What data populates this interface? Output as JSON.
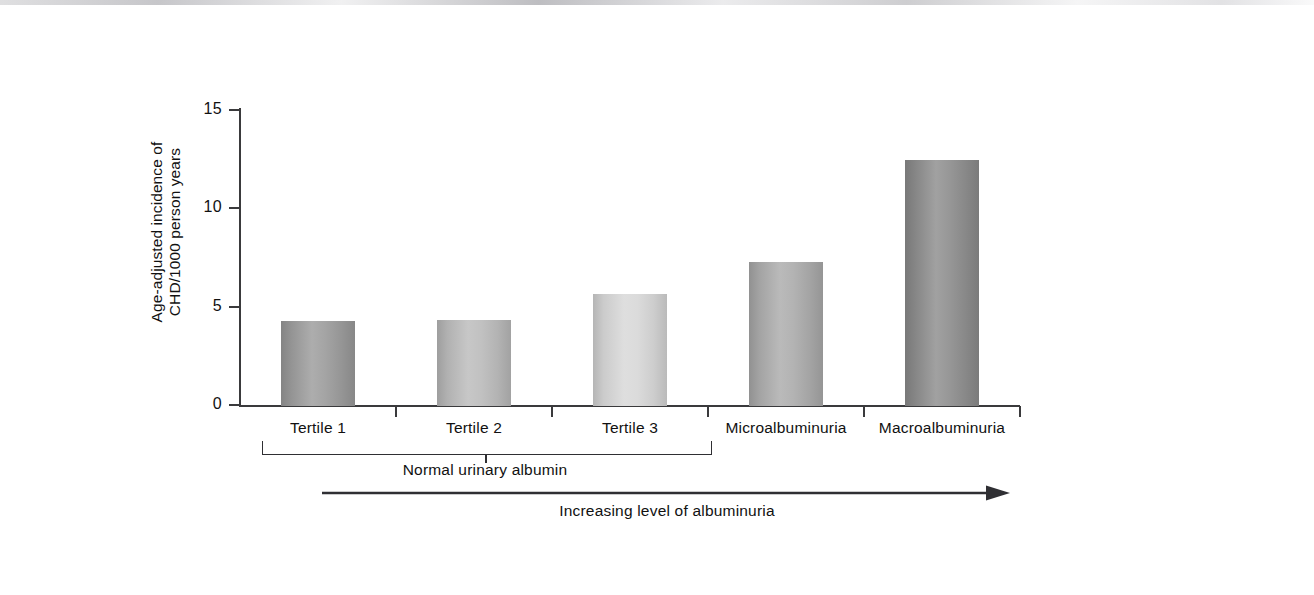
{
  "figure": {
    "y_axis_title_line1": "Age-adjusted incidence of",
    "y_axis_title_line2": "CHD/1000 person years",
    "group_bracket_label": "Normal urinary albumin",
    "trend_caption": "Increasing level of albuminuria",
    "axis_color": "#3a3a3c",
    "text_color": "#111111"
  },
  "chart_data": {
    "type": "bar",
    "title": "",
    "xlabel": "",
    "ylabel": "Age-adjusted incidence of CHD/1000 person years",
    "categories": [
      "Tertile 1",
      "Tertile 2",
      "Tertile 3",
      "Microalbuminuria",
      "Macroalbuminuria"
    ],
    "values": [
      4.3,
      4.35,
      5.7,
      7.3,
      12.5
    ],
    "ylim": [
      0,
      15
    ],
    "yticks": [
      0,
      5,
      10,
      15
    ],
    "ytick_labels": [
      "0",
      "5",
      "10",
      "15"
    ],
    "grid": false,
    "legend": "none",
    "bar_colors": [
      "#9d9d9d",
      "#bcbcbc",
      "#d8d8d8",
      "#adadad",
      "#8f8f8f"
    ],
    "annotations": [
      {
        "text": "Normal urinary albumin",
        "covers": [
          "Tertile 1",
          "Tertile 2",
          "Tertile 3"
        ]
      },
      {
        "text": "Increasing level of albuminuria",
        "kind": "arrow-left-to-right"
      }
    ]
  }
}
